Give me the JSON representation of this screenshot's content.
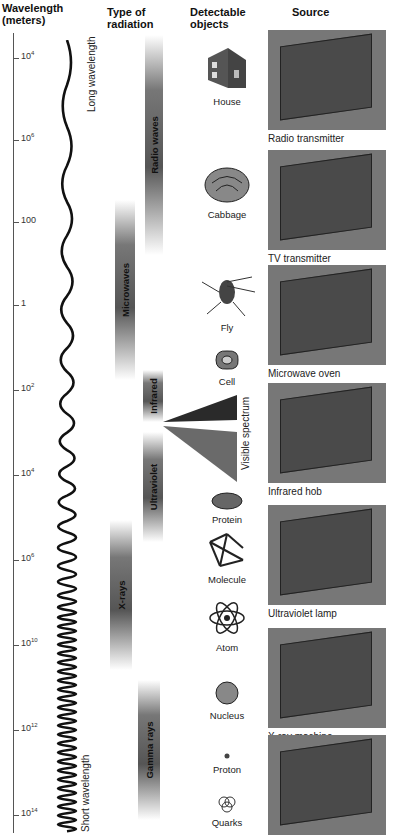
{
  "headers": {
    "wavelength": "Wavelength",
    "wavelength_unit": "(meters)",
    "type": "Type of",
    "type2": "radiation",
    "objects": "Detectable",
    "objects2": "objects",
    "source": "Source"
  },
  "axis_ticks": [
    {
      "base": "10",
      "exp": "4",
      "y": 58
    },
    {
      "base": "10",
      "exp": "6",
      "y": 140
    },
    {
      "base": "100",
      "exp": "",
      "y": 222
    },
    {
      "base": "1",
      "exp": "",
      "y": 305
    },
    {
      "base": "10",
      "exp": "2",
      "y": 390
    },
    {
      "base": "10",
      "exp": "4",
      "y": 475
    },
    {
      "base": "10",
      "exp": "6",
      "y": 560
    },
    {
      "base": "10",
      "exp": "10",
      "y": 645
    },
    {
      "base": "10",
      "exp": "12",
      "y": 730
    },
    {
      "base": "10",
      "exp": "14",
      "y": 815
    }
  ],
  "wave_labels": {
    "long": "Long wavelength",
    "short": "Short wavelength"
  },
  "radiation_types": [
    {
      "name": "Radio waves",
      "x": 145,
      "y": 35,
      "w": 18,
      "h": 220
    },
    {
      "name": "Microwaves",
      "x": 115,
      "y": 200,
      "w": 20,
      "h": 180
    },
    {
      "name": "Infrared",
      "x": 143,
      "y": 370,
      "w": 20,
      "h": 52
    },
    {
      "name": "Ultraviolet",
      "x": 143,
      "y": 432,
      "w": 20,
      "h": 110
    },
    {
      "name": "X-rays",
      "x": 110,
      "y": 520,
      "w": 22,
      "h": 150
    },
    {
      "name": "Gamma rays",
      "x": 138,
      "y": 680,
      "w": 22,
      "h": 140
    }
  ],
  "visible_spectrum": "Visible spectrum",
  "objects": [
    {
      "name": "House",
      "y": 40
    },
    {
      "name": "Cabbage",
      "y": 165
    },
    {
      "name": "Fly",
      "y": 262
    },
    {
      "name": "Cell",
      "y": 348
    },
    {
      "name": "Protein",
      "y": 490
    },
    {
      "name": "Molecule",
      "y": 530
    },
    {
      "name": "Atom",
      "y": 598
    },
    {
      "name": "Nucleus",
      "y": 680
    },
    {
      "name": "Proton",
      "y": 752
    },
    {
      "name": "Quarks",
      "y": 795
    }
  ],
  "sources": [
    {
      "name": "Radio transmitter",
      "y": 30
    },
    {
      "name": "TV transmitter",
      "y": 150
    },
    {
      "name": "Microwave oven",
      "y": 265
    },
    {
      "name": "Infrared hob",
      "y": 383
    },
    {
      "name": "Ultraviolet lamp",
      "y": 505
    },
    {
      "name": "X-ray machine",
      "y": 628
    },
    {
      "name": "",
      "y": 735
    }
  ]
}
